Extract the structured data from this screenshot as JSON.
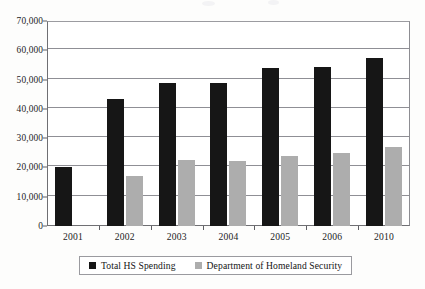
{
  "chart_data": {
    "type": "bar",
    "title": "",
    "xlabel": "",
    "ylabel": "",
    "categories": [
      "2001",
      "2002",
      "2003",
      "2004",
      "2005",
      "2006",
      "2010"
    ],
    "series": [
      {
        "name": "Total HS Spending",
        "color": "#161616",
        "values": [
          20000,
          43500,
          49000,
          49000,
          53800,
          54400,
          57300
        ]
      },
      {
        "name": "Department of Homeland Security",
        "color": "#adadad",
        "values": [
          null,
          17200,
          22600,
          22300,
          24000,
          24900,
          27000
        ]
      }
    ],
    "ylim": [
      0,
      70000
    ],
    "ytick_values": [
      0,
      10000,
      20000,
      30000,
      40000,
      50000,
      60000,
      70000
    ],
    "ytick_labels": [
      "0",
      "10,000",
      "20,000",
      "30,000",
      "40,000",
      "50,000",
      "60,000",
      "70,000"
    ],
    "grid": true,
    "grid_axis": "y",
    "legend_position": "bottom-center"
  },
  "legend": {
    "entries": [
      {
        "label": "Total HS Spending",
        "swatch": "legend-swatch-black"
      },
      {
        "label": "Department of Homeland Security",
        "swatch": "legend-swatch-gray"
      }
    ]
  }
}
